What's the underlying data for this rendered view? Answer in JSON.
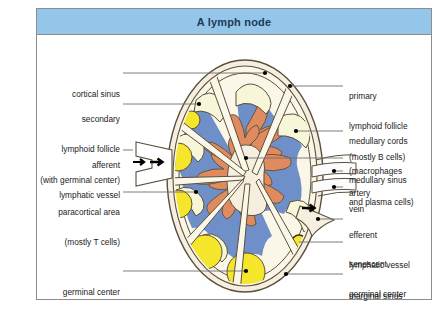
{
  "figure": {
    "title": "A lymph node",
    "title_bg": "#93c6e8",
    "title_color": "#1d3a57",
    "frame_border": "#8d8d8d",
    "background": "#ffffff"
  },
  "palette": {
    "capsule_cream": "#f6efdf",
    "sinus_cream": "#faf6e8",
    "follicle_ivory": "#f7f6d8",
    "paracortex_blue": "#6e8fc7",
    "medullary_orange": "#e08b5f",
    "germinal_yellow": "#f5e52b",
    "vessel_white": "#fbfbfb",
    "outline": "#5a4f3c",
    "leader_line": "#6e6e6e",
    "leader_dot": "#000000"
  },
  "labels_left": [
    {
      "id": "cortical-sinus",
      "lines": [
        "cortical sinus"
      ]
    },
    {
      "id": "secondary-lymphoid-follicle",
      "lines": [
        "secondary",
        "lymphoid follicle",
        "(with germinal center)"
      ]
    },
    {
      "id": "afferent-lymphatic-vessel",
      "lines": [
        "afferent",
        "lymphatic vessel"
      ]
    },
    {
      "id": "paracortical-area",
      "lines": [
        "paracortical area",
        "(mostly T cells)"
      ]
    },
    {
      "id": "germinal-center",
      "lines": [
        "germinal center"
      ]
    }
  ],
  "labels_right": [
    {
      "id": "primary-lymphoid-follicle",
      "lines": [
        "primary",
        "lymphoid follicle",
        "(mostly B cells)"
      ]
    },
    {
      "id": "medullary-cords",
      "lines": [
        "medullary cords",
        "(macrophages",
        "and plasma cells)"
      ]
    },
    {
      "id": "medullary-sinus",
      "lines": [
        "medullary sinus"
      ]
    },
    {
      "id": "artery",
      "lines": [
        "artery"
      ]
    },
    {
      "id": "vein",
      "lines": [
        "vein"
      ]
    },
    {
      "id": "efferent-lymphatic-vessel",
      "lines": [
        "efferent",
        "lymphatic vessel"
      ]
    },
    {
      "id": "senescent-germinal-center",
      "lines": [
        "senescent",
        "germinal center"
      ]
    },
    {
      "id": "marginal-sinus",
      "lines": [
        "marginal sinus"
      ]
    }
  ]
}
